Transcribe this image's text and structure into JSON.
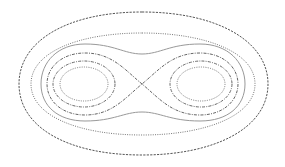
{
  "diagram": {
    "type": "level-set contour plot",
    "background": "#ffffff",
    "center_saddle": [
      142,
      84
    ],
    "lobe_centers": [
      [
        85,
        84
      ],
      [
        200,
        84
      ]
    ],
    "curves": [
      {
        "name": "outer-oval",
        "style": "dashed",
        "color": "#555555"
      },
      {
        "name": "second-oval",
        "style": "dotted",
        "color": "#777777"
      },
      {
        "name": "peanut-curve",
        "style": "solid",
        "color": "#999999"
      },
      {
        "name": "separatrix-figure-eight",
        "style": "dash-dot",
        "color": "#666666"
      },
      {
        "name": "left-lobe-ring-outer",
        "style": "dash-dot",
        "color": "#666666"
      },
      {
        "name": "left-lobe-ring-inner",
        "style": "dotted",
        "color": "#777777"
      },
      {
        "name": "right-lobe-ring-outer",
        "style": "dash-dot",
        "color": "#666666"
      },
      {
        "name": "right-lobe-ring-inner",
        "style": "dotted",
        "color": "#777777"
      }
    ]
  }
}
